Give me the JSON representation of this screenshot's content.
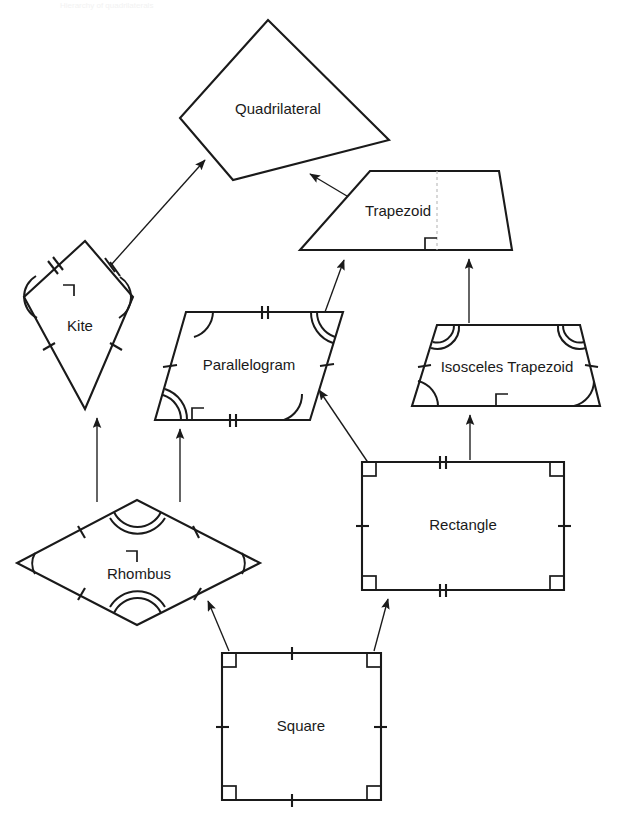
{
  "document": {
    "title": "Quadrilateral Hierarchy Diagram",
    "background_color": "#ffffff",
    "line_color": "#1a1a1a",
    "guide_color": "#b9b9b9",
    "ghost_header_text": "Hierarchy of quadrilaterals"
  },
  "shapes": {
    "quadrilateral": {
      "label": "Quadrilateral",
      "points": "268,20 389,140 233,180 180,118",
      "label_x": 278,
      "label_y": 110
    },
    "trapezoid": {
      "label": "Trapezoid",
      "points": "370,171 499,171 512,250 300,250",
      "label_x": 398,
      "label_y": 212
    },
    "kite": {
      "label": "Kite",
      "points": "85,241 133,297 85,409 24,297",
      "label_x": 80,
      "label_y": 327
    },
    "parallelogram": {
      "label": "Parallelogram",
      "points": "186,312 343,312 310,420 155,420",
      "label_x": 249,
      "label_y": 366
    },
    "isosceles_trapezoid": {
      "label": "Isosceles Trapezoid",
      "points": "437,325 580,325 600,406 412,406",
      "label_x": 507,
      "label_y": 368
    },
    "rhombus": {
      "label": "Rhombus",
      "points": "137,500 260,563 137,625 17,563",
      "label_x": 139,
      "label_y": 575
    },
    "rectangle": {
      "label": "Rectangle",
      "points": "362,462 564,462 564,590 362,590",
      "label_x": 463,
      "label_y": 526
    },
    "square": {
      "label": "Square",
      "points": "222,653 381,653 381,800 222,800",
      "label_x": 301,
      "label_y": 727
    }
  },
  "connections": [
    {
      "name": "kite-to-quadrilateral",
      "from": "kite",
      "to": "quadrilateral",
      "path": "M 111,265 L 205,160"
    },
    {
      "name": "trapezoid-to-quadrilateral",
      "from": "trapezoid",
      "to": "quadrilateral",
      "path": "M 357,200 L 308,173"
    },
    {
      "name": "parallelogram-to-trapezoid",
      "from": "parallelogram",
      "to": "trapezoid",
      "path": "M 325,310 L 343,258"
    },
    {
      "name": "isosceles-trapezoid-to-trapezoid",
      "from": "isosceles_trapezoid",
      "to": "trapezoid",
      "path": "M 469,323 L 469,258"
    },
    {
      "name": "rhombus-to-kite",
      "from": "rhombus",
      "to": "kite",
      "path": "M 97,500 L 97,417"
    },
    {
      "name": "rhombus-to-parallelogram",
      "from": "rhombus",
      "to": "parallelogram",
      "path": "M 180,500 L 180,428"
    },
    {
      "name": "rectangle-to-parallelogram",
      "from": "rectangle",
      "to": "parallelogram",
      "path": "M 368,462 L 318,388"
    },
    {
      "name": "rectangle-to-isosceles-trapezoid",
      "from": "rectangle",
      "to": "isosceles_trapezoid",
      "path": "M 470,460 L 470,414"
    },
    {
      "name": "square-to-rhombus",
      "from": "square",
      "to": "rhombus",
      "path": "M 228,651 L 207,600"
    },
    {
      "name": "square-to-rectangle",
      "from": "square",
      "to": "rectangle",
      "path": "M 375,651 L 388,598"
    }
  ],
  "legend_notes": {
    "tick_single": "congruent side (single hatch)",
    "tick_double": "congruent side (double hatch)",
    "arc_single": "congruent angle (single arc)",
    "arc_double": "congruent angle (double arc)",
    "right_angle": "right angle marker",
    "dashed_line": "diagonal or height construction line"
  }
}
